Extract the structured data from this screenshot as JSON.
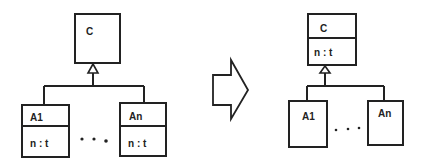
{
  "colors": {
    "stroke": "#222222",
    "background": "#ffffff"
  },
  "before": {
    "superclass": {
      "name": "C"
    },
    "subclasses": [
      {
        "name": "A1",
        "attribute": "n : t"
      },
      {
        "name": "An",
        "attribute": "n : t"
      }
    ],
    "ellipsis": "• • •"
  },
  "transform_arrow": {
    "icon": "block-arrow-right-icon"
  },
  "after": {
    "superclass": {
      "name": "C",
      "attribute": "n : t"
    },
    "subclasses": [
      {
        "name": "A1"
      },
      {
        "name": "An"
      }
    ],
    "ellipsis": "• • •"
  }
}
